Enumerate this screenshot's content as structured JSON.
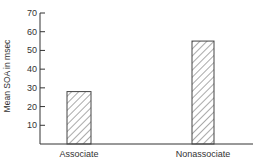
{
  "chart_data": {
    "type": "bar",
    "title": "",
    "xlabel": "",
    "ylabel": "Mean SOA in msec",
    "categories": [
      "Associate",
      "Nonassociate"
    ],
    "values": [
      28,
      55
    ],
    "ylim": [
      0,
      70
    ],
    "yticks": [
      10,
      20,
      30,
      40,
      50,
      60,
      70
    ],
    "grid": false,
    "legend": null,
    "bar_fill": "diagonal hatch",
    "colors": {
      "axis": "#333333",
      "bar_stroke": "#444444",
      "hatch": "#555555",
      "background": "#ffffff"
    }
  }
}
